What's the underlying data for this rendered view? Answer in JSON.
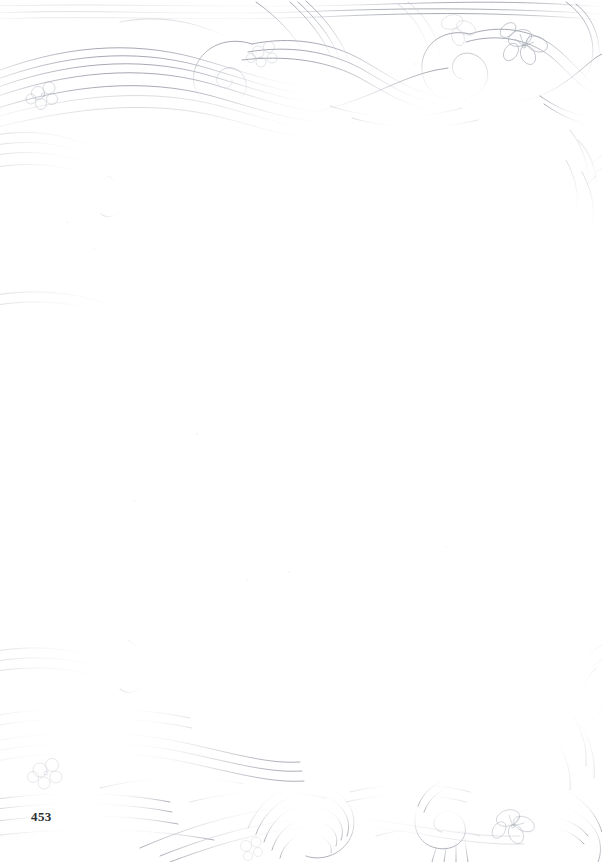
{
  "document": {
    "type": "scanned-book-page",
    "page_number": "453",
    "body_text": "",
    "background_color": "#ffffff",
    "ink_color": "#b9bcc4",
    "ink_color_dark": "#8f949e",
    "page_number_color": "#2e2e30",
    "width": 602,
    "height": 862
  },
  "ornaments": {
    "style": "floral-scrollwork-border",
    "description": "Pale pencil-grey floral scrollwork and swirling ribbon lines forming a decorative border",
    "motifs": [
      "spiral-scroll",
      "ribbon-swirl",
      "five-petal-blossom",
      "leaf-sprig"
    ],
    "regions": [
      {
        "name": "top-band",
        "label": "Top floral band"
      },
      {
        "name": "bottom-band",
        "label": "Bottom floral band"
      },
      {
        "name": "left-edge",
        "label": "Left edge flourishes"
      },
      {
        "name": "right-edge",
        "label": "Right edge flourishes"
      }
    ]
  },
  "footer": {
    "page_number_label": "453"
  }
}
